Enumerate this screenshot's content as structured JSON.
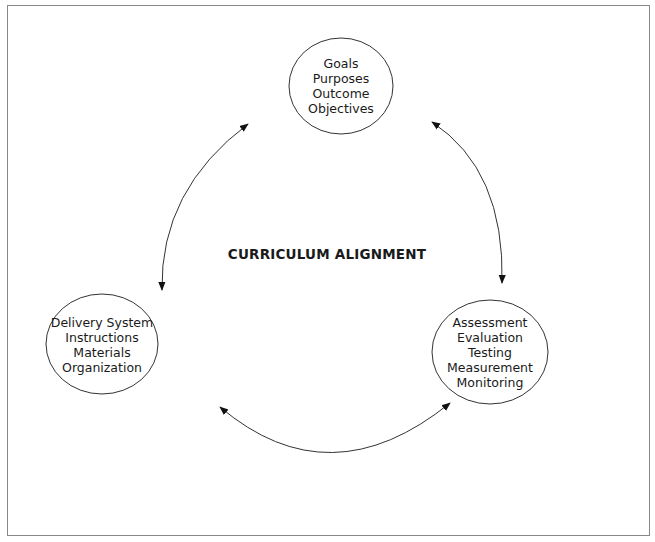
{
  "title": "CURRICULUM ALIGNMENT",
  "colors": {
    "line": "#333333",
    "text": "#1a1a1a",
    "frame": "#888888"
  },
  "nodes": {
    "top": {
      "lines": [
        "Goals",
        "Purposes",
        "Outcome",
        "Objectives"
      ]
    },
    "left": {
      "lines": [
        "Delivery System",
        "Instructions",
        "Materials",
        "Organization"
      ]
    },
    "right": {
      "lines": [
        "Assessment",
        "Evaluation",
        "Testing",
        "Measurement",
        "Monitoring"
      ]
    }
  },
  "edges": [
    {
      "from": "top",
      "to": "left",
      "type": "bidirectional-arrow"
    },
    {
      "from": "top",
      "to": "right",
      "type": "bidirectional-arrow"
    },
    {
      "from": "left",
      "to": "right",
      "type": "bidirectional-arrow"
    }
  ]
}
